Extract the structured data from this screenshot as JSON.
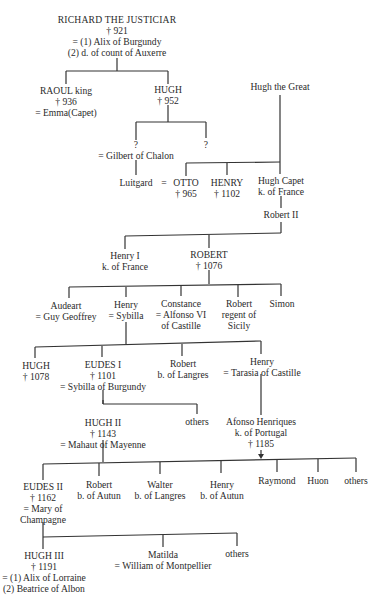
{
  "nodes": {
    "richard": {
      "name": "RICHARD THE JUSTICIAR",
      "died": "† 921",
      "m1": "= (1) Alix of Burgundy",
      "m2": "(2) d. of count of Auxerre"
    },
    "raoul": {
      "name": "RAOUL king",
      "died": "† 936",
      "spouse": "= Emma(Capet)"
    },
    "hugh_952": {
      "name": "HUGH",
      "died": "† 952"
    },
    "hugh_great": {
      "name": "Hugh the Great"
    },
    "unknown1": {
      "name": "?",
      "spouse": "= Gilbert of Chalon"
    },
    "unknown2": {
      "name": "?"
    },
    "luitgard": {
      "name": "Luitgard",
      "eq": "="
    },
    "otto": {
      "name": "OTTO",
      "died": "† 965"
    },
    "henry_1102": {
      "name": "HENRY",
      "died": "† 1102"
    },
    "hugh_capet": {
      "name": "Hugh Capet",
      "title": "k. of France"
    },
    "robert2": {
      "name": "Robert II"
    },
    "henry1": {
      "name": "Henry I",
      "title": "k. of France"
    },
    "robert_1076": {
      "name": "ROBERT",
      "died": "† 1076"
    },
    "audeart": {
      "name": "Audeart",
      "spouse": "= Guy Geoffrey"
    },
    "henry_sybilla": {
      "name": "Henry",
      "spouse": "= Sybilla"
    },
    "constance": {
      "name": "Constance",
      "spouse": "= Alfonso VI",
      "spouse2": "of Castille"
    },
    "robert_sicily": {
      "name": "Robert",
      "title": "regent of",
      "title2": "Sicily"
    },
    "simon": {
      "name": "Simon"
    },
    "hugh_1078": {
      "name": "HUGH",
      "died": "† 1078"
    },
    "eudes1": {
      "name": "EUDES I",
      "died": "† 1101",
      "spouse": "= Sybilla of Burgundy"
    },
    "robert_langres": {
      "name": "Robert",
      "title": "b. of Langres"
    },
    "henry_tarasia": {
      "name": "Henry",
      "spouse": "= Tarasia of Castille"
    },
    "hugh2": {
      "name": "HUGH II",
      "died": "† 1143",
      "spouse": "= Mahaut of Mayenne"
    },
    "others1": {
      "name": "others"
    },
    "afonso": {
      "name": "Afonso Henriques",
      "title": "k. of Portugal",
      "died": "† 1185"
    },
    "eudes2": {
      "name": "EUDES II",
      "died": "† 1162",
      "spouse": "= Mary of",
      "spouse2": "Champagne"
    },
    "robert_autun": {
      "name": "Robert",
      "title": "b. of Autun"
    },
    "walter": {
      "name": "Walter",
      "title": "b. of Langres"
    },
    "henry_autun": {
      "name": "Henry",
      "title": "b. of Autun"
    },
    "raymond": {
      "name": "Raymond"
    },
    "huon": {
      "name": "Huon"
    },
    "others2": {
      "name": "others"
    },
    "hugh3": {
      "name": "HUGH III",
      "died": "† 1191",
      "m1": "= (1) Alix of Lorraine",
      "m2": "(2) Beatrice of Albon"
    },
    "matilda": {
      "name": "Matilda",
      "spouse": "= William of Montpellier"
    },
    "others3": {
      "name": "others"
    }
  }
}
